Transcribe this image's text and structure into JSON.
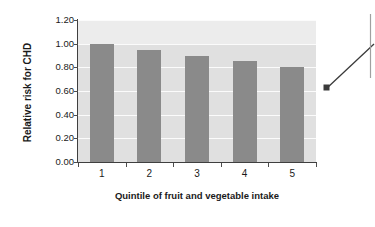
{
  "chart_data": {
    "type": "bar",
    "title": "",
    "subtitle": "",
    "xlabel": "Quintile of fruit and vegetable intake",
    "ylabel": "Relative risk for CHD",
    "categories": [
      "1",
      "2",
      "3",
      "4",
      "5"
    ],
    "values": [
      1.0,
      0.95,
      0.9,
      0.85,
      0.8
    ],
    "series": [
      {
        "name": "Relative risk for CHD",
        "values": [
          1.0,
          0.95,
          0.9,
          0.85,
          0.8
        ]
      }
    ],
    "ylim": [
      0.0,
      1.2
    ],
    "ytick_labels": [
      "0.00",
      "0.20",
      "0.40",
      "0.60",
      "0.80",
      "1.00",
      "1.20"
    ],
    "ytick_values": [
      0.0,
      0.2,
      0.4,
      0.6,
      0.8,
      1.0,
      1.2
    ],
    "xtick_labels": [
      "1",
      "2",
      "3",
      "4",
      "5"
    ],
    "grid": true,
    "grid_axis": "y",
    "legend": false,
    "legend_position": "none",
    "bar_color": "#8a8a8a",
    "plot_background": "#e0e0e0",
    "gridline_color": "#fbfbfb",
    "axis_color": "#3f3f3f",
    "text_color": "#1a1a1a",
    "annotations": [
      {
        "type": "leader-line",
        "marker": "square",
        "marker_color": "#3a3a3a",
        "points_to_category": "5",
        "points_to_value": 0.66,
        "text": ""
      },
      {
        "type": "callout-bracket",
        "orientation": "vertical",
        "color": "#9a9a9a",
        "text": ""
      }
    ]
  }
}
